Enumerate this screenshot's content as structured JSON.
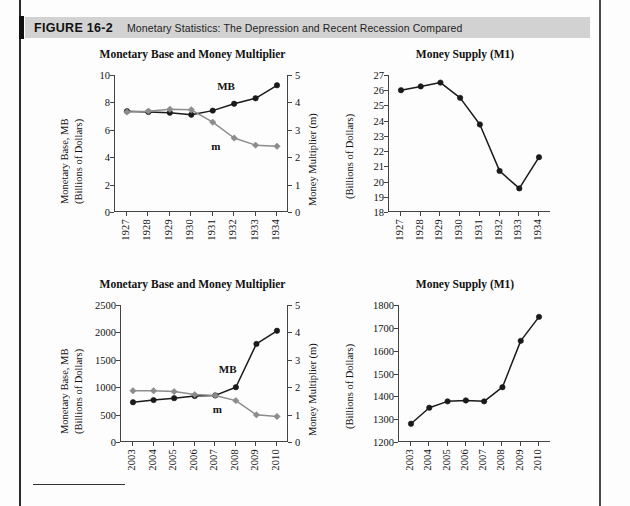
{
  "figure": {
    "label": "FIGURE 16-2",
    "caption": "Monetary Statistics: The Depression and Recent Recession Compared",
    "header_bg": "#d2d2d2",
    "accent_bar": "#111111"
  },
  "colors": {
    "mb_series": "#1a1a1a",
    "m_series": "#8c8c8c",
    "axis": "#444444",
    "text": "#111111"
  },
  "charts": [
    {
      "id": "depression-mb-m",
      "title": "Monetary Base and Money Multiplier",
      "ylabel_left": "Monetary Base, MB",
      "ylabel_left2": "(Billions of Dollars)",
      "ylabel_right": "Money Multiplier (m)",
      "mb_label": "MB",
      "m_label": "m",
      "xticks": [
        "1927",
        "1928",
        "1929",
        "1930",
        "1931",
        "1932",
        "1933",
        "1934"
      ],
      "yticks_left": [
        "0",
        "2",
        "4",
        "6",
        "8",
        "10"
      ],
      "yticks_right": [
        "0",
        "1",
        "2",
        "3",
        "4",
        "5"
      ]
    },
    {
      "id": "depression-m1",
      "title": "Money Supply (M1)",
      "ylabel_left": "(Billions of Dollars)",
      "xticks": [
        "1927",
        "1928",
        "1929",
        "1930",
        "1931",
        "1932",
        "1933",
        "1934"
      ],
      "yticks_left": [
        "18",
        "19",
        "20",
        "21",
        "22",
        "23",
        "24",
        "25",
        "26",
        "27"
      ]
    },
    {
      "id": "recession-mb-m",
      "title": "Monetary Base and Money Multiplier",
      "ylabel_left": "Monetary Base, MB",
      "ylabel_left2": "(Billions of Dollars)",
      "ylabel_right": "Money Multiplier (m)",
      "mb_label": "MB",
      "m_label": "m",
      "xticks": [
        "2003",
        "2004",
        "2005",
        "2006",
        "2007",
        "2008",
        "2009",
        "2010"
      ],
      "yticks_left": [
        "0",
        "500",
        "1000",
        "1500",
        "2000",
        "2500"
      ],
      "yticks_right": [
        "0",
        "1",
        "2",
        "3",
        "4",
        "5"
      ]
    },
    {
      "id": "recession-m1",
      "title": "Money Supply (M1)",
      "ylabel_left": "(Billions of Dollars)",
      "xticks": [
        "2003",
        "2004",
        "2005",
        "2006",
        "2007",
        "2008",
        "2009",
        "2010"
      ],
      "yticks_left": [
        "1200",
        "1300",
        "1400",
        "1500",
        "1600",
        "1700",
        "1800"
      ]
    }
  ],
  "chart_data": [
    {
      "type": "line",
      "id": "depression-mb-m",
      "title": "Monetary Base and Money Multiplier",
      "subtitle": "The Depression",
      "xlabel": "",
      "ylabel": "Monetary Base, MB (Billions of Dollars)",
      "ylabel_secondary": "Money Multiplier (m)",
      "categories": [
        1927,
        1928,
        1929,
        1930,
        1931,
        1932,
        1933,
        1934
      ],
      "ylim": [
        0,
        10
      ],
      "ylim_secondary": [
        0,
        5
      ],
      "yticks": [
        0,
        2,
        4,
        6,
        8,
        10
      ],
      "yticks_secondary": [
        0,
        1,
        2,
        3,
        4,
        5
      ],
      "grid": false,
      "legend": "inline-annotation",
      "series": [
        {
          "name": "MB",
          "axis": "left",
          "color": "#1a1a1a",
          "marker": "circle",
          "values": [
            7.35,
            7.3,
            7.25,
            7.1,
            7.4,
            7.9,
            8.3,
            9.25
          ]
        },
        {
          "name": "m",
          "axis": "right",
          "color": "#8c8c8c",
          "marker": "diamond",
          "values": [
            3.65,
            3.68,
            3.75,
            3.73,
            3.28,
            2.7,
            2.44,
            2.4
          ]
        }
      ]
    },
    {
      "type": "line",
      "id": "depression-m1",
      "title": "Money Supply (M1)",
      "subtitle": "The Depression",
      "xlabel": "",
      "ylabel": "(Billions of Dollars)",
      "categories": [
        1927,
        1928,
        1929,
        1930,
        1931,
        1932,
        1933,
        1934
      ],
      "ylim": [
        18,
        27
      ],
      "yticks": [
        18,
        19,
        20,
        21,
        22,
        23,
        24,
        25,
        26,
        27
      ],
      "grid": false,
      "series": [
        {
          "name": "M1",
          "axis": "left",
          "color": "#1a1a1a",
          "marker": "circle",
          "values": [
            26.0,
            26.25,
            26.5,
            25.5,
            23.75,
            20.7,
            19.55,
            21.6
          ]
        }
      ]
    },
    {
      "type": "line",
      "id": "recession-mb-m",
      "title": "Monetary Base and Money Multiplier",
      "subtitle": "Recent Recession",
      "xlabel": "",
      "ylabel": "Monetary Base, MB (Billions of Dollars)",
      "ylabel_secondary": "Money Multiplier (m)",
      "categories": [
        2003,
        2004,
        2005,
        2006,
        2007,
        2008,
        2009,
        2010
      ],
      "ylim": [
        0,
        2500
      ],
      "ylim_secondary": [
        0,
        5
      ],
      "yticks": [
        0,
        500,
        1000,
        1500,
        2000,
        2500
      ],
      "yticks_secondary": [
        0,
        1,
        2,
        3,
        4,
        5
      ],
      "grid": false,
      "legend": "inline-annotation",
      "series": [
        {
          "name": "MB",
          "axis": "left",
          "color": "#1a1a1a",
          "marker": "circle",
          "values": [
            725,
            765,
            800,
            840,
            850,
            1000,
            1790,
            2030
          ]
        },
        {
          "name": "m",
          "axis": "right",
          "color": "#8c8c8c",
          "marker": "diamond",
          "values": [
            1.87,
            1.87,
            1.84,
            1.73,
            1.7,
            1.51,
            0.99,
            0.93
          ]
        }
      ]
    },
    {
      "type": "line",
      "id": "recession-m1",
      "title": "Money Supply (M1)",
      "subtitle": "Recent Recession",
      "xlabel": "",
      "ylabel": "(Billions of Dollars)",
      "categories": [
        2003,
        2004,
        2005,
        2006,
        2007,
        2008,
        2009,
        2010
      ],
      "ylim": [
        1200,
        1800
      ],
      "yticks": [
        1200,
        1300,
        1400,
        1500,
        1600,
        1700,
        1800
      ],
      "grid": false,
      "series": [
        {
          "name": "M1",
          "axis": "left",
          "color": "#1a1a1a",
          "marker": "circle",
          "values": [
            1280,
            1350,
            1378,
            1382,
            1378,
            1440,
            1643,
            1748
          ]
        }
      ]
    }
  ]
}
